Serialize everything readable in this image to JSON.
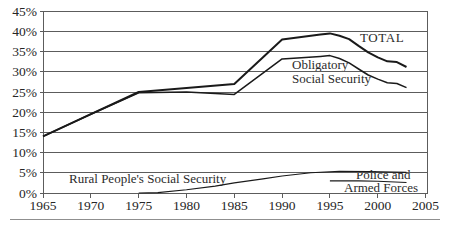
{
  "colors": {
    "line": "#1a1a1a",
    "grid": "#5c5c5c",
    "text": "#262626",
    "separator": "#8f8f8f",
    "background": "#ffffff"
  },
  "chart_data": {
    "type": "line",
    "title": "",
    "xlabel": "",
    "ylabel": "",
    "xlim": [
      1965,
      2005
    ],
    "ylim": [
      0,
      45
    ],
    "grid": true,
    "legend_position": "inline-annotations",
    "x_ticks": [
      {
        "value": 1965,
        "label": "1965"
      },
      {
        "value": 1970,
        "label": "1970"
      },
      {
        "value": 1975,
        "label": "1975"
      },
      {
        "value": 1980,
        "label": "1980"
      },
      {
        "value": 1985,
        "label": "1985"
      },
      {
        "value": 1990,
        "label": "1990"
      },
      {
        "value": 1995,
        "label": "1995"
      },
      {
        "value": 2000,
        "label": "2000"
      },
      {
        "value": 2005,
        "label": "2005"
      }
    ],
    "y_ticks": [
      {
        "value": 0,
        "label": "0%"
      },
      {
        "value": 5,
        "label": "5%"
      },
      {
        "value": 10,
        "label": "10%"
      },
      {
        "value": 15,
        "label": "15%"
      },
      {
        "value": 20,
        "label": "20%"
      },
      {
        "value": 25,
        "label": "25%"
      },
      {
        "value": 30,
        "label": "30%"
      },
      {
        "value": 35,
        "label": "35%"
      },
      {
        "value": 40,
        "label": "40%"
      },
      {
        "value": 45,
        "label": "45%"
      }
    ],
    "series": [
      {
        "name": "TOTAL",
        "points": [
          [
            1965,
            14
          ],
          [
            1970,
            19.5
          ],
          [
            1975,
            25
          ],
          [
            1980,
            26
          ],
          [
            1985,
            27
          ],
          [
            1990,
            38
          ],
          [
            1992,
            38.6
          ],
          [
            1994,
            39.2
          ],
          [
            1995,
            39.5
          ],
          [
            1996,
            38.9
          ],
          [
            1997,
            38.1
          ],
          [
            1998,
            36.4
          ],
          [
            1999,
            34.8
          ],
          [
            2000,
            33.6
          ],
          [
            2001,
            32.6
          ],
          [
            2002,
            32.4
          ],
          [
            2003,
            31.2
          ]
        ]
      },
      {
        "name": "Obligatory Social Security",
        "points": [
          [
            1965,
            14
          ],
          [
            1970,
            19.5
          ],
          [
            1975,
            24.8
          ],
          [
            1980,
            25
          ],
          [
            1985,
            24.4
          ],
          [
            1990,
            33.2
          ],
          [
            1992,
            33.5
          ],
          [
            1994,
            33.8
          ],
          [
            1995,
            34
          ],
          [
            1996,
            33.3
          ],
          [
            1997,
            32.2
          ],
          [
            1998,
            30.7
          ],
          [
            1999,
            29.2
          ],
          [
            2000,
            28.2
          ],
          [
            2001,
            27.3
          ],
          [
            2002,
            27.1
          ],
          [
            2003,
            26.1
          ]
        ]
      },
      {
        "name": "Rural People's Social Security",
        "points": [
          [
            1975,
            0
          ],
          [
            1977,
            0.1
          ],
          [
            1980,
            0.8
          ],
          [
            1983,
            1.7
          ],
          [
            1985,
            2.5
          ],
          [
            1988,
            3.5
          ],
          [
            1990,
            4.2
          ],
          [
            1993,
            5.0
          ],
          [
            1996,
            5.4
          ],
          [
            1999,
            5.3
          ],
          [
            2003,
            5.1
          ]
        ]
      },
      {
        "name": "Police and Armed Forces",
        "points": [
          [
            1995,
            3.0
          ],
          [
            1998,
            3.0
          ],
          [
            2000,
            2.9
          ],
          [
            2003,
            2.6
          ]
        ]
      }
    ],
    "annotations": {
      "total_label": "TOTAL",
      "obligatory_label_line1": "Obligatory",
      "obligatory_label_line2": "Social Security",
      "rural_label": "Rural People's Social Security",
      "police_label_line1": "Police and",
      "police_label_line2": "Armed Forces"
    }
  }
}
